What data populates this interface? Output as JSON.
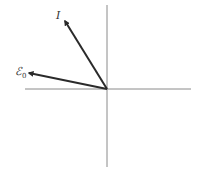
{
  "diagram": {
    "type": "phasor",
    "origin": [
      107,
      89
    ],
    "axes": {
      "horizontal": {
        "x1": 25,
        "x2": 191,
        "y": 89
      },
      "vertical": {
        "x": 107,
        "y1": 5,
        "y2": 167
      },
      "color": "#8a8a8a"
    },
    "vectors": [
      {
        "name": "I",
        "label": "I",
        "subscript": "",
        "tip": [
          64,
          20
        ],
        "color": "#2a2a2a"
      },
      {
        "name": "E0",
        "label": "ℰ",
        "subscript": "0",
        "tip": [
          28,
          73
        ],
        "color": "#2a2a2a"
      }
    ]
  }
}
